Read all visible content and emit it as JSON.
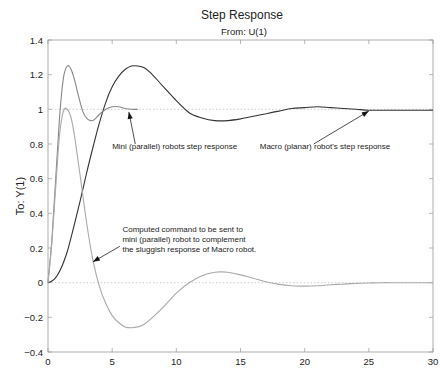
{
  "chart_data": {
    "type": "line",
    "title": "Step Response",
    "subtitle": "From: U(1)",
    "xlabel": "",
    "ylabel": "To: Y(1)",
    "xlim": [
      0,
      30
    ],
    "ylim": [
      -0.4,
      1.4
    ],
    "xticks": [
      "0",
      "5",
      "10",
      "15",
      "20",
      "25",
      "30"
    ],
    "yticks": [
      "-0.4",
      "-0.2",
      "0",
      "0.2",
      "0.4",
      "0.6",
      "0.8",
      "1",
      "1.2",
      "1.4"
    ],
    "grid": false,
    "reference_lines": [
      1,
      0
    ],
    "series": [
      {
        "name": "Macro (planar) robot's step response",
        "color": "#333333",
        "x": [
          0,
          0.5,
          1,
          1.5,
          2,
          2.5,
          3,
          3.5,
          4,
          4.5,
          5,
          5.5,
          6,
          6.5,
          7,
          7.5,
          8,
          9,
          10,
          11,
          12,
          13,
          14,
          15,
          16,
          17,
          18,
          19,
          20,
          21,
          22,
          23,
          24,
          25,
          26,
          27,
          28,
          29,
          30
        ],
        "y": [
          0,
          0.02,
          0.08,
          0.18,
          0.32,
          0.47,
          0.63,
          0.78,
          0.92,
          1.04,
          1.13,
          1.19,
          1.23,
          1.25,
          1.25,
          1.24,
          1.21,
          1.13,
          1.05,
          0.98,
          0.95,
          0.935,
          0.935,
          0.945,
          0.96,
          0.975,
          0.99,
          1.005,
          1.01,
          1.015,
          1.01,
          1.005,
          1.0,
          0.995,
          0.995,
          0.995,
          0.995,
          0.995,
          0.995
        ]
      },
      {
        "name": "Mini (parallel) robots step response",
        "color": "#888888",
        "x": [
          0,
          0.3,
          0.6,
          0.9,
          1.2,
          1.5,
          1.8,
          2.1,
          2.4,
          2.7,
          3.0,
          3.3,
          3.6,
          4.0,
          4.5,
          5.0,
          5.5,
          6.0,
          6.5,
          7.0
        ],
        "y": [
          0,
          0.25,
          0.6,
          0.95,
          1.18,
          1.25,
          1.23,
          1.16,
          1.07,
          0.99,
          0.95,
          0.935,
          0.94,
          0.97,
          1.0,
          1.015,
          1.015,
          1.005,
          1.0,
          1.0
        ]
      },
      {
        "name": "Computed command to be sent to mini (parallel) robot to complement the sluggish response of Macro robot.",
        "color": "#aaaaaa",
        "x": [
          0,
          0.3,
          0.6,
          0.9,
          1.2,
          1.5,
          1.8,
          2.1,
          2.5,
          3.0,
          3.5,
          4.0,
          4.5,
          5.0,
          5.5,
          6.0,
          6.5,
          7.0,
          7.5,
          8.0,
          9.0,
          10.0,
          11.0,
          12.0,
          13.0,
          13.5,
          14.0,
          15.0,
          16.0,
          17.0,
          18.0,
          19.0,
          20.0,
          21.0,
          22.0,
          23.0,
          24.0,
          25.0,
          26.0,
          27.0,
          28.0,
          29.0,
          30.0
        ],
        "y": [
          0,
          0.23,
          0.55,
          0.85,
          0.99,
          1.0,
          0.95,
          0.83,
          0.62,
          0.35,
          0.13,
          -0.02,
          -0.12,
          -0.19,
          -0.23,
          -0.255,
          -0.26,
          -0.255,
          -0.24,
          -0.21,
          -0.14,
          -0.06,
          0.0,
          0.04,
          0.06,
          0.062,
          0.06,
          0.045,
          0.025,
          0.005,
          -0.01,
          -0.018,
          -0.02,
          -0.018,
          -0.012,
          -0.008,
          -0.004,
          -0.002,
          0.0,
          0.0,
          0.0,
          0.0,
          0.0
        ]
      }
    ],
    "annotations": [
      {
        "lines": [
          "Mini (parallel) robots step response"
        ],
        "text_at": [
          5.0,
          0.77
        ],
        "arrow_from": [
          6.8,
          0.8
        ],
        "arrow_to": [
          6.3,
          0.985
        ]
      },
      {
        "lines": [
          "Macro (planar) robot's step response"
        ],
        "text_at": [
          16.5,
          0.77
        ],
        "arrow_from": [
          20.7,
          0.8
        ],
        "arrow_to": [
          25.0,
          0.99
        ]
      },
      {
        "lines": [
          "Computed command to be sent to",
          "mini (parallel) robot to complement",
          "the sluggish response of Macro robot."
        ],
        "text_at": [
          5.8,
          0.29
        ],
        "arrow_from": [
          5.6,
          0.21
        ],
        "arrow_to": [
          3.5,
          0.12
        ]
      }
    ]
  }
}
